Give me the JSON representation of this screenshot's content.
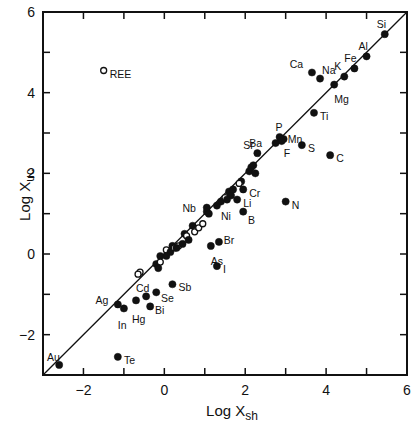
{
  "chart_data": {
    "type": "scatter",
    "title": "",
    "xlabel": "Log X",
    "xlabel_sub": "sh",
    "ylabel": "Log X",
    "ylabel_sub": "uc",
    "xlim": [
      -3,
      6
    ],
    "ylim": [
      -3,
      6
    ],
    "x_ticks_labeled": [
      -2,
      0,
      2,
      4,
      6
    ],
    "y_ticks_labeled": [
      -2,
      0,
      2,
      4,
      6
    ],
    "x_minor_ticks": [
      -2,
      -1,
      0,
      1,
      2,
      3,
      4,
      5
    ],
    "y_minor_ticks": [
      -2,
      -1,
      0,
      1,
      2,
      3,
      4,
      5
    ],
    "grid": false,
    "reference_line": {
      "type": "y=x",
      "from": [
        -3,
        -3
      ],
      "to": [
        6,
        6
      ]
    },
    "labeled_points": [
      {
        "label": "Si",
        "x": 5.45,
        "y": 5.45,
        "filled": true,
        "lx": -0.2,
        "ly": 0.25
      },
      {
        "label": "Al",
        "x": 5.0,
        "y": 4.9,
        "filled": true,
        "lx": -0.2,
        "ly": 0.25
      },
      {
        "label": "Fe",
        "x": 4.7,
        "y": 4.6,
        "filled": true,
        "lx": -0.25,
        "ly": 0.25
      },
      {
        "label": "K",
        "x": 4.45,
        "y": 4.4,
        "filled": true,
        "lx": -0.25,
        "ly": 0.25
      },
      {
        "label": "Ca",
        "x": 3.65,
        "y": 4.5,
        "filled": true,
        "lx": -0.55,
        "ly": 0.2
      },
      {
        "label": "Na",
        "x": 3.85,
        "y": 4.35,
        "filled": true,
        "lx": 0.05,
        "ly": 0.2
      },
      {
        "label": "Mg",
        "x": 4.2,
        "y": 4.2,
        "filled": true,
        "lx": 0.0,
        "ly": -0.35
      },
      {
        "label": "Ti",
        "x": 3.7,
        "y": 3.5,
        "filled": true,
        "lx": 0.15,
        "ly": -0.08
      },
      {
        "label": "P",
        "x": 2.85,
        "y": 2.9,
        "filled": true,
        "lx": -0.1,
        "ly": 0.25
      },
      {
        "label": "Mn",
        "x": 2.95,
        "y": 2.85,
        "filled": true,
        "lx": 0.1,
        "ly": 0.0
      },
      {
        "label": "Ba",
        "x": 2.75,
        "y": 2.75,
        "filled": true,
        "lx": -0.65,
        "ly": 0.0
      },
      {
        "label": "F",
        "x": 2.9,
        "y": 2.8,
        "filled": true,
        "lx": 0.05,
        "ly": -0.3
      },
      {
        "label": "S",
        "x": 3.4,
        "y": 2.7,
        "filled": true,
        "lx": 0.15,
        "ly": -0.08
      },
      {
        "label": "C",
        "x": 4.1,
        "y": 2.45,
        "filled": true,
        "lx": 0.15,
        "ly": -0.08
      },
      {
        "label": "Sr",
        "x": 2.3,
        "y": 2.5,
        "filled": true,
        "lx": -0.35,
        "ly": 0.2
      },
      {
        "label": "Cr",
        "x": 1.95,
        "y": 1.6,
        "filled": true,
        "lx": 0.15,
        "ly": -0.08
      },
      {
        "label": "N",
        "x": 3.0,
        "y": 1.3,
        "filled": true,
        "lx": 0.15,
        "ly": -0.08
      },
      {
        "label": "Li",
        "x": 1.8,
        "y": 1.35,
        "filled": true,
        "lx": 0.15,
        "ly": -0.08
      },
      {
        "label": "B",
        "x": 1.95,
        "y": 1.05,
        "filled": true,
        "lx": 0.12,
        "ly": -0.2
      },
      {
        "label": "Ni",
        "x": 1.55,
        "y": 1.35,
        "filled": true,
        "lx": -0.15,
        "ly": -0.4
      },
      {
        "label": "Nb",
        "x": 1.05,
        "y": 1.15,
        "filled": true,
        "lx": -0.6,
        "ly": 0.0
      },
      {
        "label": "Br",
        "x": 1.35,
        "y": 0.3,
        "filled": true,
        "lx": 0.12,
        "ly": 0.05
      },
      {
        "label": "As",
        "x": 1.15,
        "y": 0.2,
        "filled": true,
        "lx": 0.0,
        "ly": -0.38
      },
      {
        "label": "I",
        "x": 1.3,
        "y": -0.3,
        "filled": true,
        "lx": 0.15,
        "ly": -0.08
      },
      {
        "label": "Sb",
        "x": 0.2,
        "y": -0.75,
        "filled": true,
        "lx": 0.15,
        "ly": -0.08
      },
      {
        "label": "Se",
        "x": -0.2,
        "y": -0.95,
        "filled": true,
        "lx": 0.12,
        "ly": -0.15
      },
      {
        "label": "Cd",
        "x": -0.45,
        "y": -1.05,
        "filled": true,
        "lx": -0.25,
        "ly": 0.2
      },
      {
        "label": "Hg",
        "x": -0.7,
        "y": -1.15,
        "filled": true,
        "lx": -0.1,
        "ly": -0.45
      },
      {
        "label": "Bi",
        "x": -0.35,
        "y": -1.3,
        "filled": true,
        "lx": 0.12,
        "ly": -0.08
      },
      {
        "label": "Ag",
        "x": -1.15,
        "y": -1.25,
        "filled": true,
        "lx": -0.55,
        "ly": 0.1
      },
      {
        "label": "In",
        "x": -1.0,
        "y": -1.35,
        "filled": true,
        "lx": -0.15,
        "ly": -0.4
      },
      {
        "label": "Te",
        "x": -1.15,
        "y": -2.55,
        "filled": true,
        "lx": 0.15,
        "ly": -0.08
      },
      {
        "label": "Au",
        "x": -2.6,
        "y": -2.75,
        "filled": true,
        "lx": -0.3,
        "ly": 0.2
      },
      {
        "label": "REE",
        "x": -1.5,
        "y": 4.55,
        "filled": false,
        "lx": 0.15,
        "ly": -0.08
      }
    ],
    "unlabeled_points": [
      {
        "x": -0.6,
        "y": -0.45,
        "filled": false
      },
      {
        "x": -0.65,
        "y": -0.5,
        "filled": false
      },
      {
        "x": -0.2,
        "y": -0.25,
        "filled": true
      },
      {
        "x": -0.1,
        "y": -0.05,
        "filled": true
      },
      {
        "x": -0.1,
        "y": -0.2,
        "filled": false
      },
      {
        "x": 0.05,
        "y": 0.1,
        "filled": false
      },
      {
        "x": 0.15,
        "y": 0.05,
        "filled": true
      },
      {
        "x": 0.2,
        "y": 0.2,
        "filled": true
      },
      {
        "x": 0.25,
        "y": 0.15,
        "filled": false
      },
      {
        "x": 0.35,
        "y": 0.2,
        "filled": false
      },
      {
        "x": 0.45,
        "y": 0.25,
        "filled": true
      },
      {
        "x": 0.5,
        "y": 0.5,
        "filled": true
      },
      {
        "x": 0.55,
        "y": 0.45,
        "filled": false
      },
      {
        "x": 0.6,
        "y": 0.35,
        "filled": true
      },
      {
        "x": 0.7,
        "y": 0.7,
        "filled": true
      },
      {
        "x": 0.75,
        "y": 0.55,
        "filled": false
      },
      {
        "x": 0.85,
        "y": 0.65,
        "filled": false
      },
      {
        "x": 0.95,
        "y": 0.75,
        "filled": false
      },
      {
        "x": 1.05,
        "y": 1.05,
        "filled": true
      },
      {
        "x": 1.1,
        "y": 1.0,
        "filled": true
      },
      {
        "x": 1.3,
        "y": 1.2,
        "filled": true
      },
      {
        "x": 1.4,
        "y": 1.3,
        "filled": true
      },
      {
        "x": 1.5,
        "y": 1.4,
        "filled": false
      },
      {
        "x": 1.6,
        "y": 1.55,
        "filled": true
      },
      {
        "x": 1.65,
        "y": 1.45,
        "filled": true
      },
      {
        "x": 1.7,
        "y": 1.6,
        "filled": true
      },
      {
        "x": 1.9,
        "y": 1.8,
        "filled": true
      },
      {
        "x": 1.85,
        "y": 1.75,
        "filled": false
      },
      {
        "x": 2.1,
        "y": 2.05,
        "filled": true
      },
      {
        "x": 2.15,
        "y": 2.15,
        "filled": true
      },
      {
        "x": 2.2,
        "y": 2.2,
        "filled": true
      },
      {
        "x": 2.25,
        "y": 2.0,
        "filled": true
      },
      {
        "x": -0.15,
        "y": -0.35,
        "filled": true
      },
      {
        "x": 0.05,
        "y": -0.05,
        "filled": true
      },
      {
        "x": 0.3,
        "y": 0.15,
        "filled": true
      }
    ]
  },
  "axes": {
    "x_label_main": "Log X",
    "x_label_sub": "sh",
    "y_label_main": "Log X",
    "y_label_sub": "uc"
  }
}
